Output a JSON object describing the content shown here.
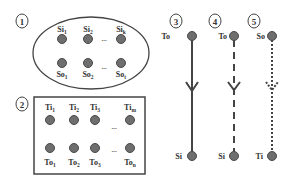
{
  "colors": {
    "line": "#444444",
    "node_fill": "#6e6e6e",
    "node_stroke": "#4a4a4a",
    "label": "#333333",
    "background": "#ffffff"
  },
  "panel1": {
    "number": "1",
    "shape": "ellipse",
    "top_nodes": [
      {
        "base": "Si",
        "sub": "1"
      },
      {
        "base": "Si",
        "sub": "2"
      },
      {
        "base": "Si",
        "sub": "k"
      }
    ],
    "bottom_nodes": [
      {
        "base": "So",
        "sub": "1"
      },
      {
        "base": "So",
        "sub": "2"
      },
      {
        "base": "So",
        "sub": "t"
      }
    ],
    "ellipsis": "..."
  },
  "panel2": {
    "number": "2",
    "shape": "rectangle",
    "top_nodes": [
      {
        "base": "Ti",
        "sub": "1"
      },
      {
        "base": "Ti",
        "sub": "2"
      },
      {
        "base": "Ti",
        "sub": "3"
      },
      {
        "base": "Ti",
        "sub": "m"
      }
    ],
    "bottom_nodes": [
      {
        "base": "To",
        "sub": "1"
      },
      {
        "base": "To",
        "sub": "2"
      },
      {
        "base": "To",
        "sub": "3"
      },
      {
        "base": "To",
        "sub": "n"
      }
    ],
    "ellipsis": "..."
  },
  "panel3": {
    "number": "3",
    "from": "To",
    "to": "Si",
    "line_style": "solid"
  },
  "panel4": {
    "number": "4",
    "from": "To",
    "to": "Si",
    "line_style": "dashed"
  },
  "panel5": {
    "number": "5",
    "from": "So",
    "to": "Ti",
    "line_style": "dotted"
  }
}
